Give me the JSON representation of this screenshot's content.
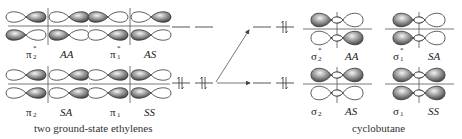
{
  "diagram": {
    "colors": {
      "line": "#555555",
      "lobe_shaded_dark": "#444444",
      "lobe_shaded_light": "#eeeeee",
      "lobe_outline": "#333333"
    },
    "ethylene": {
      "caption": "two ground-state ethylenes",
      "orbitals": [
        {
          "id": "pi2_star",
          "symbol": "π",
          "sub": "2",
          "sup": "*",
          "symmetry": "AA",
          "row": "top",
          "lobes": {
            "tl": "right",
            "tr": "right",
            "bl": "left",
            "br": "left"
          }
        },
        {
          "id": "pi1_star",
          "symbol": "π",
          "sub": "1",
          "sup": "*",
          "symmetry": "AS",
          "row": "top",
          "lobes": {
            "tl": "left",
            "tr": "right",
            "bl": "right",
            "br": "left"
          }
        },
        {
          "id": "pi2",
          "symbol": "π",
          "sub": "2",
          "sup": "",
          "symmetry": "SA",
          "row": "bottom",
          "lobes": {
            "tl": "right",
            "tr": "right",
            "bl": "right",
            "br": "right"
          }
        },
        {
          "id": "pi1",
          "symbol": "π",
          "sub": "1",
          "sup": "",
          "symmetry": "SS",
          "row": "bottom",
          "lobes": {
            "tl": "right",
            "tr": "left",
            "bl": "right",
            "br": "left"
          }
        }
      ],
      "levels": [
        {
          "row": "top",
          "electrons": 0
        },
        {
          "row": "bottom",
          "electrons": 4
        }
      ]
    },
    "cyclobutane": {
      "caption": "cyclobutane",
      "orbitals": [
        {
          "id": "sigma2_star",
          "symbol": "σ",
          "sub": "2",
          "sup": "*",
          "symmetry": "AA",
          "row": "top",
          "lobes": {
            "tl": "shaded",
            "tr": "open",
            "bl": "open",
            "br": "shaded"
          }
        },
        {
          "id": "sigma1_star",
          "symbol": "σ",
          "sub": "1",
          "sup": "*",
          "symmetry": "SA",
          "row": "top",
          "lobes": {
            "tl": "shaded",
            "tr": "open",
            "bl": "shaded",
            "br": "open"
          }
        },
        {
          "id": "sigma2",
          "symbol": "σ",
          "sub": "2",
          "sup": "",
          "symmetry": "AS",
          "row": "bottom",
          "lobes": {
            "tl": "shaded",
            "tr": "shaded",
            "bl": "open",
            "br": "open"
          }
        },
        {
          "id": "sigma1",
          "symbol": "σ",
          "sub": "1",
          "sup": "",
          "symmetry": "SS",
          "row": "bottom",
          "lobes": {
            "tl": "shaded",
            "tr": "shaded",
            "bl": "shaded",
            "br": "shaded"
          }
        }
      ],
      "levels": [
        {
          "row": "top",
          "electrons": 2
        },
        {
          "row": "bottom",
          "electrons": 2
        }
      ]
    },
    "correlation_arrows": [
      {
        "from": "ethylene.bottom",
        "to": "cyclobutane.top"
      },
      {
        "from": "ethylene.bottom",
        "to": "cyclobutane.bottom"
      }
    ]
  },
  "labels": {
    "pi2_star": {
      "sym": "π",
      "sub": "2",
      "sup": "*",
      "symmetry": "AA"
    },
    "pi1_star": {
      "sym": "π",
      "sub": "1",
      "sup": "*",
      "symmetry": "AS"
    },
    "pi2": {
      "sym": "π",
      "sub": "2",
      "symmetry": "SA"
    },
    "pi1": {
      "sym": "π",
      "sub": "1",
      "symmetry": "SS"
    },
    "sigma2_star": {
      "sym": "σ",
      "sub": "2",
      "sup": "*",
      "symmetry": "AA"
    },
    "sigma1_star": {
      "sym": "σ",
      "sub": "1",
      "sup": "*",
      "symmetry": "SA"
    },
    "sigma2": {
      "sym": "σ",
      "sub": "2",
      "symmetry": "AS"
    },
    "sigma1": {
      "sym": "σ",
      "sub": "1",
      "symmetry": "SS"
    },
    "caption_left": "two ground-state ethylenes",
    "caption_right": "cyclobutane"
  }
}
